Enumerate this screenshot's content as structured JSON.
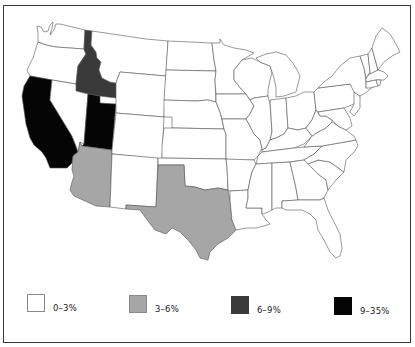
{
  "map": {
    "title": "",
    "region": "Contiguous United States",
    "colors": {
      "bin_0_3": "#ffffff",
      "bin_3_6": "#a6a6a6",
      "bin_6_9": "#3a3a3a",
      "bin_9_35": "#050505"
    },
    "shaded_states": [
      {
        "state": "California",
        "bin": "9–35%"
      },
      {
        "state": "Utah",
        "bin": "9–35%"
      },
      {
        "state": "Idaho",
        "bin": "6–9%"
      },
      {
        "state": "Arizona",
        "bin": "3–6%"
      },
      {
        "state": "Texas",
        "bin": "3–6%"
      }
    ],
    "default_bin": "0–3%"
  },
  "legend": {
    "items": [
      {
        "label": "0–3%",
        "color": "#ffffff"
      },
      {
        "label": "3–6%",
        "color": "#a6a6a6"
      },
      {
        "label": "6–9%",
        "color": "#3a3a3a"
      },
      {
        "label": "9–35%",
        "color": "#050505"
      }
    ]
  }
}
